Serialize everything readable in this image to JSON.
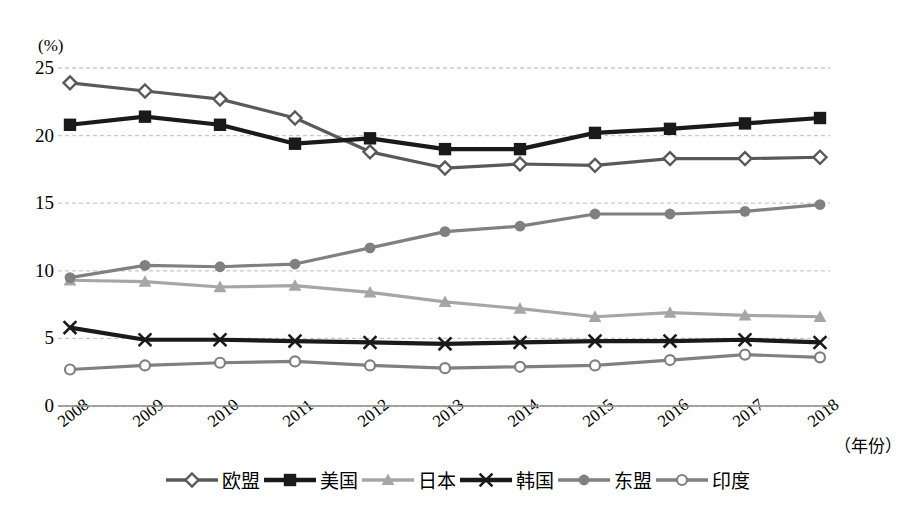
{
  "chart_data": {
    "type": "line",
    "title": "",
    "xlabel": "（年份）",
    "ylabel": "(%)",
    "ylim": [
      0,
      25
    ],
    "yticks": [
      0,
      5,
      10,
      15,
      20,
      25
    ],
    "grid": true,
    "legend_position": "bottom",
    "categories": [
      "2008",
      "2009",
      "2010",
      "2011",
      "2012",
      "2013",
      "2014",
      "2015",
      "2016",
      "2017",
      "2018"
    ],
    "series": [
      {
        "name": "欧盟",
        "marker": "open-diamond",
        "color": "#595959",
        "values": [
          23.9,
          23.3,
          22.7,
          21.3,
          18.8,
          17.6,
          17.9,
          17.8,
          18.3,
          18.3,
          18.4
        ]
      },
      {
        "name": "美国",
        "marker": "filled-square",
        "color": "#1a1a1a",
        "values": [
          20.8,
          21.4,
          20.8,
          19.4,
          19.8,
          19.0,
          19.0,
          20.2,
          20.5,
          20.9,
          21.3
        ]
      },
      {
        "name": "日本",
        "marker": "filled-triangle",
        "color": "#a6a6a6",
        "values": [
          9.3,
          9.2,
          8.8,
          8.9,
          8.4,
          7.7,
          7.2,
          6.6,
          6.9,
          6.7,
          6.6
        ]
      },
      {
        "name": "韩国",
        "marker": "x-cross",
        "color": "#1a1a1a",
        "values": [
          5.8,
          4.9,
          4.9,
          4.8,
          4.7,
          4.6,
          4.7,
          4.8,
          4.8,
          4.9,
          4.7
        ]
      },
      {
        "name": "东盟",
        "marker": "filled-circle",
        "color": "#808080",
        "values": [
          9.5,
          10.4,
          10.3,
          10.5,
          11.7,
          12.9,
          13.3,
          14.2,
          14.2,
          14.4,
          14.9
        ]
      },
      {
        "name": "印度",
        "marker": "open-circle",
        "color": "#808080",
        "values": [
          2.7,
          3.0,
          3.2,
          3.3,
          3.0,
          2.8,
          2.9,
          3.0,
          3.4,
          3.8,
          3.6
        ]
      }
    ]
  },
  "axis": {
    "unit_label": "(%)",
    "x_title": "（年份）",
    "y_tick_labels": [
      "25",
      "20",
      "15",
      "10",
      "5",
      "0"
    ],
    "x_tick_labels": [
      "2008",
      "2009",
      "2010",
      "2011",
      "2012",
      "2013",
      "2014",
      "2015",
      "2016",
      "2017",
      "2018"
    ]
  },
  "legend": {
    "items": [
      {
        "label": "欧盟"
      },
      {
        "label": "美国"
      },
      {
        "label": "日本"
      },
      {
        "label": "韩国"
      },
      {
        "label": "东盟"
      },
      {
        "label": "印度"
      }
    ]
  },
  "colors": {
    "eu": "#595959",
    "usa": "#1a1a1a",
    "japan": "#a6a6a6",
    "korea": "#1a1a1a",
    "asean": "#808080",
    "india": "#808080",
    "grid": "#c9c9c9",
    "axis": "#8a8a8a"
  }
}
